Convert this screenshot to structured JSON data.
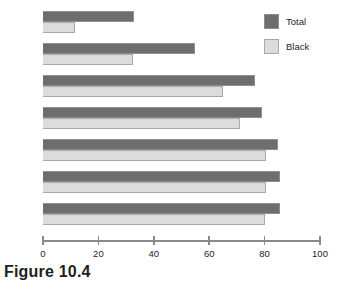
{
  "caption": "Figure 10.4",
  "legend": {
    "position": "top-right",
    "entries": [
      {
        "label": "Total",
        "color": "#6e6e6e",
        "name": "total"
      },
      {
        "label": "Black",
        "color": "#dcdcdc",
        "name": "black"
      }
    ]
  },
  "axis": {
    "tick_labels": [
      "0",
      "20",
      "40",
      "60",
      "80",
      "100"
    ],
    "tick_values": [
      0,
      20,
      40,
      60,
      80,
      100
    ],
    "min": 0,
    "max": 100
  },
  "chart_data": {
    "type": "bar",
    "orientation": "horizontal",
    "title": "Figure 10.4",
    "xlabel": "",
    "ylabel": "",
    "xlim": [
      0,
      100
    ],
    "ylim": null,
    "grid": false,
    "legend_position": "top-right",
    "xticks": [
      0,
      20,
      40,
      60,
      80,
      100
    ],
    "categories": [
      "1950",
      "1970",
      "1990",
      "2000",
      "2005",
      "2006",
      "2007"
    ],
    "series": [
      {
        "name": "Total",
        "color": "#6e6e6e",
        "values": [
          33,
          55,
          76.5,
          79,
          85,
          85.5,
          85.5
        ]
      },
      {
        "name": "Black",
        "color": "#dcdcdc",
        "values": [
          11.5,
          32.5,
          65,
          71,
          80.5,
          80.5,
          80
        ]
      }
    ]
  }
}
